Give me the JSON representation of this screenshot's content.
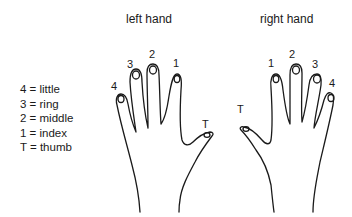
{
  "titles": {
    "left": "left hand",
    "right": "right hand"
  },
  "legend": [
    {
      "key": "4",
      "value": "little"
    },
    {
      "key": "3",
      "value": "ring"
    },
    {
      "key": "2",
      "value": "middle"
    },
    {
      "key": "1",
      "value": "index"
    },
    {
      "key": "T",
      "value": "thumb"
    }
  ],
  "legend_text": [
    "4 = little",
    "3 = ring",
    "2 = middle",
    "1 = index",
    "T = thumb"
  ],
  "left_hand_labels": {
    "little": "4",
    "ring": "3",
    "middle": "2",
    "index": "1",
    "thumb": "T"
  },
  "right_hand_labels": {
    "thumb": "T",
    "index": "1",
    "middle": "2",
    "ring": "3",
    "little": "4"
  }
}
